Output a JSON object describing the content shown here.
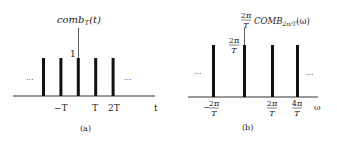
{
  "panel_a": {
    "function_label": "comb",
    "function_subscript": "T",
    "function_arg": "(t)",
    "height_label": "1",
    "left_ellipsis": "...",
    "right_ellipsis": "...",
    "tick_labels": [
      "−T",
      "T",
      "2T"
    ],
    "axis_label": "t",
    "caption": "(a)",
    "impulse_count": 5
  },
  "panel_b": {
    "function_coef_num": "2π",
    "function_coef_den": "T",
    "function_label": "COMB",
    "function_subscript": "2π/T",
    "function_arg": "(ω)",
    "height_num": "2π",
    "height_den": "T",
    "left_ellipsis": "...",
    "right_ellipsis": "...",
    "tick_labels": [
      {
        "sign": "−",
        "num": "2π",
        "den": "T"
      },
      {
        "sign": "",
        "num": "2π",
        "den": "T"
      },
      {
        "sign": "",
        "num": "4π",
        "den": "T"
      }
    ],
    "axis_label": "ω",
    "caption": "(b)",
    "impulse_count": 4
  }
}
